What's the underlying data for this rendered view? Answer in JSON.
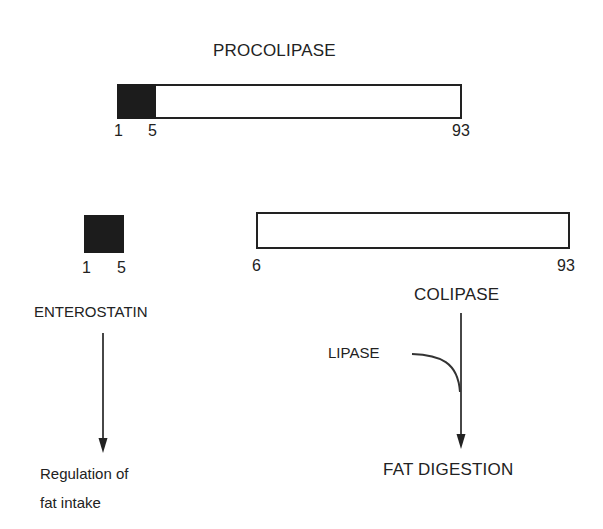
{
  "procolipase": {
    "title": "PROCOLIPASE",
    "start_label": "1",
    "cleave_label": "5",
    "end_label": "93"
  },
  "enterostatin": {
    "start_label": "1",
    "end_label": "5",
    "name": "ENTEROSTATIN",
    "outcome_line1": "Regulation of",
    "outcome_line2": "fat intake"
  },
  "colipase": {
    "start_label": "6",
    "end_label": "93",
    "name": "COLIPASE",
    "cofactor": "LIPASE",
    "outcome": "FAT DIGESTION"
  },
  "colors": {
    "ink": "#222222",
    "filled_segment": "#1c1c1c",
    "background": "#ffffff"
  }
}
